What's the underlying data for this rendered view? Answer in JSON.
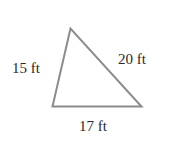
{
  "diagram": {
    "type": "triangle",
    "stroke_color": "#8c8c8c",
    "vertices": {
      "top": [
        70.5,
        28.5
      ],
      "bottom_left": [
        52.5,
        106.5
      ],
      "bottom_right": [
        141.5,
        106.5
      ]
    },
    "sides": [
      {
        "id": "left",
        "label": "15 ft"
      },
      {
        "id": "right",
        "label": "20 ft"
      },
      {
        "id": "bottom",
        "label": "17 ft"
      }
    ]
  }
}
